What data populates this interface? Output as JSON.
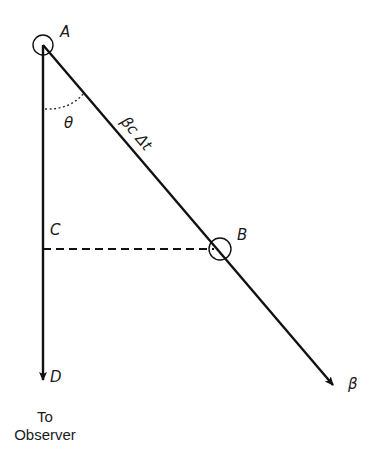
{
  "diagram": {
    "points": {
      "A": "A",
      "B": "B",
      "C": "C",
      "D": "D"
    },
    "angle_label": "θ",
    "segment_label": "βc Δt",
    "velocity_label": "β",
    "observer_caption": {
      "line1": "To",
      "line2": "Observer"
    },
    "colors": {
      "line": "#111111",
      "background": "#ffffff"
    }
  }
}
